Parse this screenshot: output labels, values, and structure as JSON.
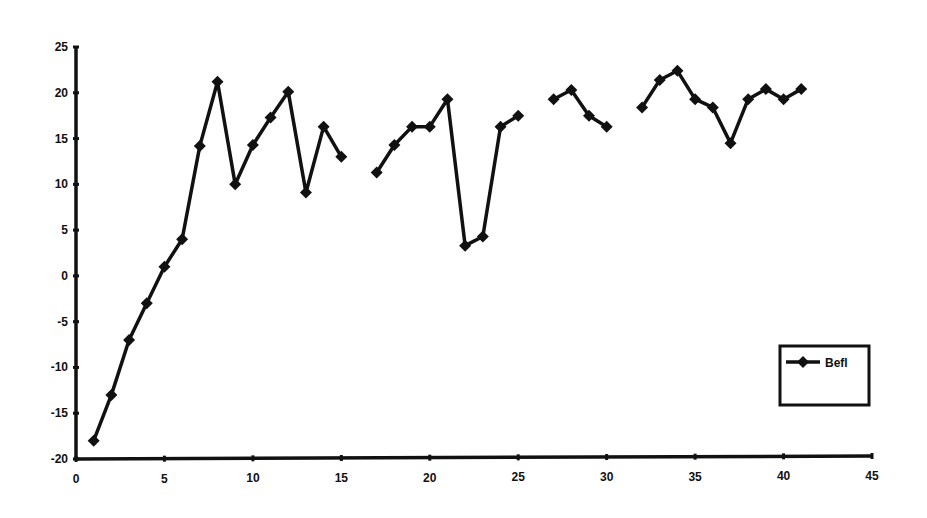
{
  "chart_data": {
    "type": "line",
    "title": "",
    "xlabel": "",
    "ylabel": "",
    "xlim": [
      0,
      45
    ],
    "ylim": [
      -20,
      25
    ],
    "x_ticks": [
      0,
      5,
      10,
      15,
      20,
      25,
      30,
      35,
      40,
      45
    ],
    "y_ticks": [
      25,
      20,
      15,
      10,
      5,
      0,
      -5,
      -10,
      -15,
      -20
    ],
    "grid": false,
    "legend_position": "right-lower, inside plot",
    "series": [
      {
        "name": "Befl",
        "color": "#111111",
        "marker": "diamond",
        "x": [
          1,
          2,
          3,
          4,
          5,
          6,
          7,
          8,
          9,
          10,
          11,
          12,
          13,
          14,
          15,
          16,
          17,
          18,
          19,
          20,
          21,
          22,
          23,
          24,
          25,
          26,
          27,
          28,
          29,
          30,
          31,
          32,
          33,
          34,
          35,
          36,
          37,
          38,
          39,
          40,
          41
        ],
        "values": [
          -18,
          -13,
          -7,
          -3,
          1,
          4,
          14.2,
          21.2,
          10,
          14.3,
          17.3,
          20.1,
          9.1,
          16.3,
          13,
          null,
          11.3,
          14.3,
          16.3,
          16.3,
          19.3,
          3.3,
          4.3,
          16.3,
          17.5,
          null,
          19.3,
          20.3,
          17.5,
          16.3,
          null,
          18.4,
          21.4,
          22.4,
          19.3,
          18.4,
          14.5,
          19.3,
          20.4,
          19.3,
          20.4
        ]
      }
    ]
  },
  "legend": {
    "label": "Befl"
  }
}
